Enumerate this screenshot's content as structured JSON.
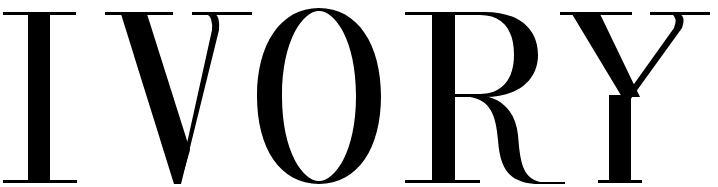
{
  "logo": {
    "text": "IVORY",
    "letters": [
      "I",
      "V",
      "O",
      "R",
      "Y"
    ],
    "color": "#000000",
    "background": "#ffffff"
  }
}
